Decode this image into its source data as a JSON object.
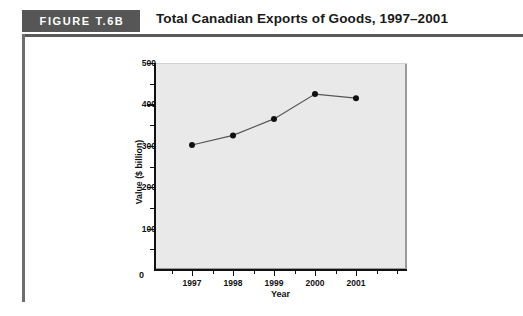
{
  "figure": {
    "badge_label": "FIGURE T.6B",
    "title": "Total Canadian Exports of Goods, 1997–2001"
  },
  "chart_data": {
    "type": "line",
    "title": "Total Canadian Exports of Goods, 1997–2001",
    "xlabel": "Year",
    "ylabel": "Value ($ billion)",
    "categories": [
      "1997",
      "1998",
      "1999",
      "2000",
      "2001"
    ],
    "values": [
      302,
      325,
      365,
      425,
      415
    ],
    "ylim": [
      0,
      500
    ],
    "y_major_ticks": [
      0,
      100,
      200,
      300,
      400,
      500
    ],
    "y_minor_ticks": [
      50,
      150,
      250,
      350,
      450
    ],
    "y_tick_labels": [
      "0",
      "100",
      "200",
      "300",
      "400",
      "500"
    ],
    "x_tick_labels": [
      "1997",
      "1998",
      "1999",
      "2000",
      "2001"
    ],
    "grid": false,
    "legend": null,
    "marker": "filled-circle",
    "line_color": "#555555",
    "marker_color": "#111111",
    "plot_background": "#e9e9e9",
    "zero_label": "0"
  }
}
